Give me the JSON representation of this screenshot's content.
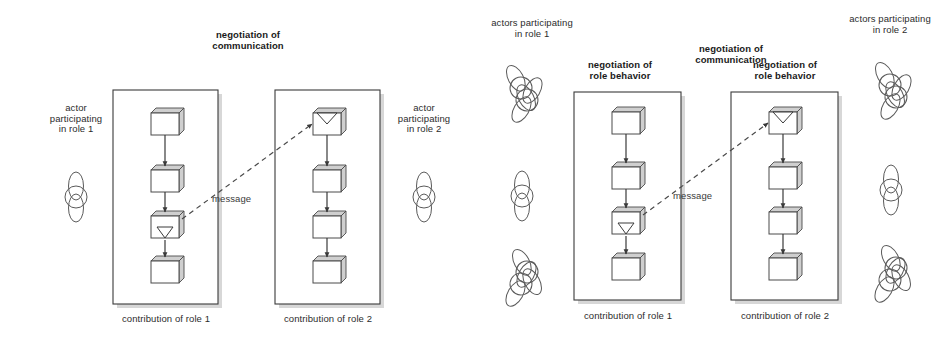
{
  "diagram": {
    "title_hidden": "",
    "background_color": "#ffffff",
    "line_color": "#3a3a3a",
    "shadow_color": "#c9c9c9",
    "node_top_color": "#cfcfcf",
    "panels": [
      {
        "id": "left-panel",
        "top_center_label": "negotiation of\ncommunication",
        "left_actor_label": "actor\nparticipating\nin role 1",
        "right_actor_label": "actor\nparticipating\nin role 2",
        "message_label": "message",
        "lanes": [
          {
            "id": "lane-role-1",
            "bottom_label": "contribution of role 1",
            "nodes": [
              {
                "kind": "plain"
              },
              {
                "kind": "plain"
              },
              {
                "kind": "send"
              },
              {
                "kind": "plain"
              }
            ]
          },
          {
            "id": "lane-role-2",
            "bottom_label": "contribution of role 2",
            "nodes": [
              {
                "kind": "receive"
              },
              {
                "kind": "plain"
              },
              {
                "kind": "plain"
              },
              {
                "kind": "plain"
              }
            ]
          }
        ]
      },
      {
        "id": "right-panel",
        "top_center_label": "negotiation of\ncommunication",
        "left_actor_label": "actors participating\nin role 1",
        "right_actor_label": "actors participating\nin role 2",
        "left_lane_top_label": "negotiation of\nrole behavior",
        "right_lane_top_label": "negotiation of\nrole behavior",
        "message_label": "message",
        "lanes": [
          {
            "id": "lane-role-1",
            "bottom_label": "contribution of role 1",
            "nodes": [
              {
                "kind": "plain"
              },
              {
                "kind": "plain"
              },
              {
                "kind": "send"
              },
              {
                "kind": "plain"
              }
            ]
          },
          {
            "id": "lane-role-2",
            "bottom_label": "contribution of role 2",
            "nodes": [
              {
                "kind": "receive"
              },
              {
                "kind": "plain"
              },
              {
                "kind": "plain"
              },
              {
                "kind": "plain"
              }
            ]
          }
        ]
      }
    ],
    "legend_notes": {
      "actor_glyph": "actor-figure-icon",
      "send_glyph": "send-triangle-icon",
      "receive_glyph": "receive-notch-icon",
      "message_glyph": "dashed-arrow-icon"
    }
  }
}
